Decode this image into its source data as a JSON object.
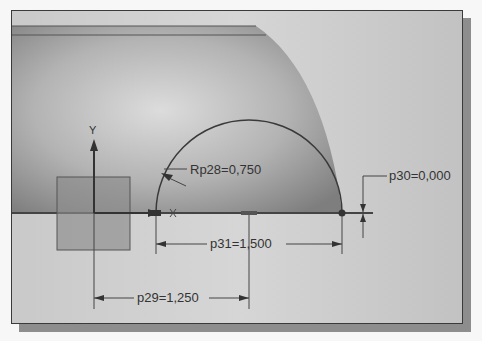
{
  "viewport": {
    "title": "Sketch viewport",
    "axis_y_label": "Y",
    "origin_marker": "x-mark"
  },
  "colors": {
    "background": "#c6c6c6",
    "part_shade": "#9a9a9a",
    "line": "#3a3a3a",
    "shadow": "#8d8d8d"
  },
  "dimensions": {
    "radius": {
      "name": "Rp28",
      "value": "0,750",
      "label": "Rp28=0,750"
    },
    "vertical_offset": {
      "name": "p30",
      "value": "0,000",
      "label": "p30=0,000"
    },
    "arc_width": {
      "name": "p31",
      "value": "1,500",
      "label": "p31=1,500"
    },
    "origin_offset": {
      "name": "p29",
      "value": "1,250",
      "label": "p29=1,250"
    }
  }
}
